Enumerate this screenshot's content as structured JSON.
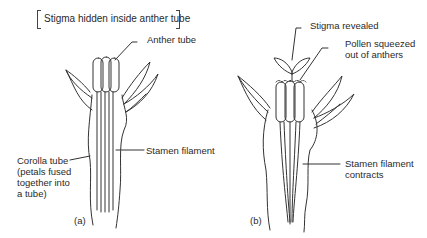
{
  "title": "Stigma hidden inside anther tube",
  "panel_a": {
    "tag": "(a)",
    "labels": {
      "anther_tube": "Anther tube",
      "stamen_filament": "Stamen filament",
      "corolla_tube": "Corolla tube\n(petals fused\ntogether into\na tube)"
    }
  },
  "panel_b": {
    "tag": "(b)",
    "labels": {
      "stigma_revealed": "Stigma revealed",
      "pollen": "Pollen squeezed\nout of anthers",
      "stamen_contracts": "Stamen filament\ncontracts"
    }
  },
  "colors": {
    "line": "#333333",
    "text": "#2a2a2a",
    "background": "#ffffff"
  }
}
